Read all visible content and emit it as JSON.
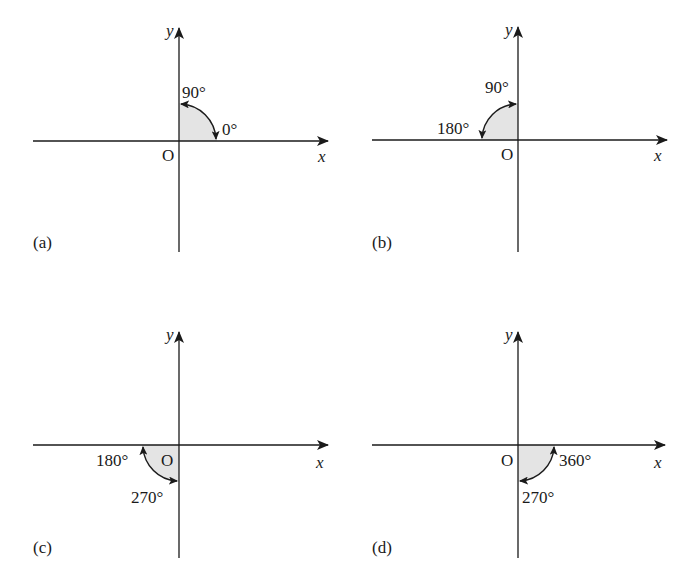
{
  "figure": {
    "panels": [
      {
        "id": "a",
        "label": "(a)",
        "origin_label": "O",
        "x_axis_label": "x",
        "y_axis_label": "y",
        "quadrant": "first",
        "start_angle_label": "0°",
        "end_angle_label": "90°",
        "arrow_direction": "both"
      },
      {
        "id": "b",
        "label": "(b)",
        "origin_label": "O",
        "x_axis_label": "x",
        "y_axis_label": "y",
        "quadrant": "second",
        "start_angle_label": "90°",
        "end_angle_label": "180°",
        "arrow_direction": "both"
      },
      {
        "id": "c",
        "label": "(c)",
        "origin_label": "O",
        "x_axis_label": "x",
        "y_axis_label": "y",
        "quadrant": "third",
        "start_angle_label": "180°",
        "end_angle_label": "270°",
        "arrow_direction": "both"
      },
      {
        "id": "d",
        "label": "(d)",
        "origin_label": "O",
        "x_axis_label": "x",
        "y_axis_label": "y",
        "quadrant": "fourth",
        "start_angle_label": "270°",
        "end_angle_label": "360°",
        "arrow_direction": "both"
      }
    ],
    "colors": {
      "line": "#1a1a1a",
      "shade": "#e4e4e4",
      "background": "#ffffff"
    }
  }
}
